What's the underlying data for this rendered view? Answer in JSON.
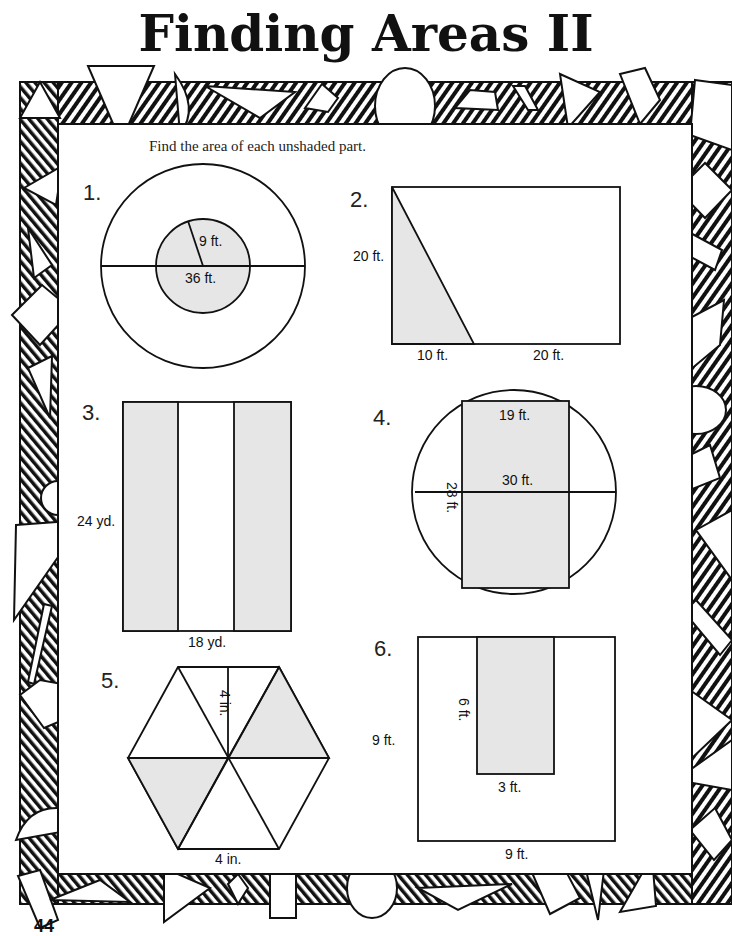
{
  "page": {
    "title": "Finding Areas II",
    "instructions": "Find the area of each unshaded part.",
    "page_number": "44"
  },
  "colors": {
    "ink": "#111111",
    "shade": "#e6e6e6",
    "paper": "#ffffff"
  },
  "problems": [
    {
      "number": "1.",
      "shape": "concentric-circles",
      "labels": {
        "radius_inner": "9 ft.",
        "diameter_outer": "36 ft."
      },
      "shaded": "inner circle"
    },
    {
      "number": "2.",
      "shape": "rectangle-with-triangle",
      "labels": {
        "height": "20 ft.",
        "base_left": "10 ft.",
        "base_right": "20 ft."
      },
      "shaded": "left triangle"
    },
    {
      "number": "3.",
      "shape": "rectangle-three-strips",
      "labels": {
        "height": "24 yd.",
        "width": "18 yd."
      },
      "shaded": "outer strips"
    },
    {
      "number": "4.",
      "shape": "rectangle-in-circle",
      "labels": {
        "rect_width": "19 ft.",
        "diameter": "30 ft.",
        "rect_height": "28 ft."
      },
      "shaded": "rectangle"
    },
    {
      "number": "5.",
      "shape": "hexagon-six-triangles",
      "labels": {
        "height": "4 in.",
        "side": "4 in."
      },
      "shaded": "two triangles"
    },
    {
      "number": "6.",
      "shape": "square-with-rectangle",
      "labels": {
        "rect_height": "6 ft.",
        "rect_width": "3 ft.",
        "square_height": "9 ft.",
        "square_width": "9 ft."
      },
      "shaded": "inner rectangle"
    }
  ]
}
